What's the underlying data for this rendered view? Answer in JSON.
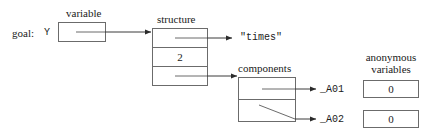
{
  "diagram": {
    "title_label": "goal:",
    "goal_var_name": "Y",
    "captions": {
      "variable": "variable",
      "structure": "structure",
      "components": "components",
      "anonymous_line1": "anonymous",
      "anonymous_line2": "variables"
    },
    "boxes": {
      "variable_cell": {
        "caption": "variable",
        "content": "",
        "is_pointer": true
      },
      "structure": {
        "caption": "structure",
        "cells": [
          {
            "content": "",
            "is_pointer": true,
            "points_to": "\"times\""
          },
          {
            "content": "2",
            "is_pointer": false,
            "points_to": ""
          },
          {
            "content": "",
            "is_pointer": true,
            "points_to": "components"
          }
        ]
      },
      "components": {
        "caption": "components",
        "cells": [
          {
            "content": "",
            "is_pointer": true,
            "points_to": "_A01"
          },
          {
            "content": "",
            "is_pointer": true,
            "points_to": "_A02"
          }
        ]
      },
      "anonymous_variables": [
        {
          "name": "_A01",
          "value": "0"
        },
        {
          "name": "_A02",
          "value": "0"
        }
      ]
    },
    "functor_label": "\"times\"",
    "arity_label": "2",
    "colors": {
      "stroke": "#4a4a4a",
      "text": "#1a1a1a",
      "background": "#ffffff"
    }
  }
}
